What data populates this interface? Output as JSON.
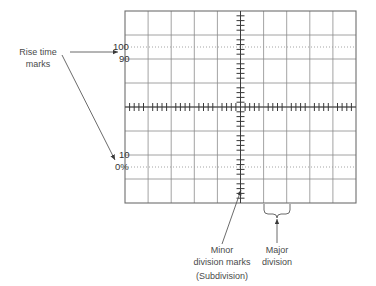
{
  "figure": {
    "background_color": "#ffffff",
    "grid_line_color": "#8c8c8c",
    "grid_border_color": "#6e6e6e",
    "dotted_line_color": "#9a9a9a",
    "tick_color": "#3a3a3a",
    "annotation_color": "#4a4a4a",
    "leader_color": "#5a5a5a"
  },
  "graticule": {
    "major_divisions_horizontal": 10,
    "major_divisions_vertical": 8,
    "minor_divisions_per_major": 5,
    "left": 125,
    "top": 11,
    "right": 356,
    "bottom": 203,
    "cell_width": 23.1,
    "cell_height": 24.0
  },
  "scale_labels": [
    {
      "text": "100",
      "value": 100,
      "y": 47,
      "line_style": "dotted"
    },
    {
      "text": "90",
      "value": 90,
      "y": 59,
      "line_style": "solid"
    },
    {
      "text": "10",
      "value": 10,
      "y": 155,
      "line_style": "solid"
    },
    {
      "text": "0%",
      "value": 0,
      "y": 167,
      "line_style": "dotted"
    }
  ],
  "annotations": {
    "rise_time": {
      "line1": "Rise time",
      "line2": "marks"
    },
    "minor_division": {
      "line1": "Minor",
      "line2": "division marks",
      "line3": "(Subdivision)"
    },
    "major_division": {
      "line1": "Major",
      "line2": "division"
    }
  }
}
